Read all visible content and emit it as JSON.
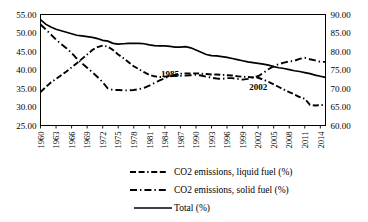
{
  "chart_data": {
    "type": "line",
    "title": "",
    "xlabel": "",
    "ylabel": "",
    "grid": false,
    "legend_position": "bottom",
    "x": [
      1960,
      1961,
      1962,
      1963,
      1964,
      1965,
      1966,
      1967,
      1968,
      1969,
      1970,
      1971,
      1972,
      1973,
      1974,
      1975,
      1976,
      1977,
      1978,
      1979,
      1980,
      1981,
      1982,
      1983,
      1984,
      1985,
      1986,
      1987,
      1988,
      1989,
      1990,
      1991,
      1992,
      1993,
      1994,
      1995,
      1996,
      1997,
      1998,
      1999,
      2000,
      2001,
      2002,
      2003,
      2004,
      2005,
      2006,
      2007,
      2008,
      2009,
      2010,
      2011,
      2012,
      2013,
      2014,
      2015
    ],
    "x_tick_labels": [
      "1960",
      "1963",
      "1966",
      "1969",
      "1972",
      "1975",
      "1978",
      "1981",
      "1984",
      "1987",
      "1990",
      "1993",
      "1996",
      "1999",
      "2002",
      "2005",
      "2008",
      "2011",
      "2014"
    ],
    "left_axis": {
      "ticks": [
        "55.00",
        "50.00",
        "45.00",
        "40.00",
        "35.00",
        "30.00",
        "25.00"
      ],
      "ylim": [
        25.0,
        55.0
      ],
      "applies_to": [
        "CO2 emissions, liquid fuel (%)",
        "CO2 emissions, solid fuel (%)"
      ]
    },
    "right_axis": {
      "ticks": [
        "90.00",
        "85.00",
        "80.00",
        "75.00",
        "70.00",
        "65.00",
        "60.00"
      ],
      "ylim": [
        60.0,
        90.0
      ],
      "applies_to": [
        "Total (%)"
      ]
    },
    "annotations": [
      {
        "text": "1985",
        "x": 1985,
        "y": 38.2
      },
      {
        "text": "2002",
        "x": 2002,
        "y": 34.6
      }
    ],
    "series": [
      {
        "name": "CO2 emissions, liquid fuel (%)",
        "axis": "left",
        "style": "dash-dash-dot",
        "values": [
          34.0,
          35.4,
          36.6,
          37.6,
          38.6,
          39.6,
          40.7,
          41.8,
          43.0,
          44.2,
          45.4,
          46.2,
          46.6,
          46.3,
          45.4,
          44.2,
          43.2,
          42.1,
          41.0,
          40.2,
          39.4,
          38.7,
          38.3,
          38.1,
          38.2,
          38.4,
          38.7,
          39.0,
          39.1,
          39.1,
          39.1,
          39.0,
          38.9,
          38.8,
          38.8,
          38.7,
          38.6,
          38.5,
          38.3,
          38.2,
          38.1,
          38.0,
          37.9,
          37.4,
          36.8,
          36.1,
          35.4,
          34.7,
          34.0,
          33.4,
          32.7,
          32.2,
          30.6,
          30.4,
          30.5,
          30.6
        ]
      },
      {
        "name": "CO2 emissions, solid fuel (%)",
        "axis": "left",
        "style": "dash-dot",
        "values": [
          52.3,
          51.0,
          49.6,
          48.2,
          47.0,
          45.9,
          44.6,
          43.1,
          41.8,
          40.6,
          39.4,
          38.1,
          36.7,
          35.0,
          34.6,
          34.6,
          34.5,
          34.5,
          34.6,
          34.8,
          35.2,
          35.8,
          36.5,
          37.2,
          37.8,
          38.3,
          38.4,
          38.4,
          38.5,
          38.6,
          38.7,
          38.5,
          38.2,
          37.9,
          37.7,
          37.6,
          37.8,
          37.8,
          37.6,
          37.4,
          37.6,
          38.0,
          38.3,
          39.2,
          40.2,
          41.0,
          41.6,
          42.0,
          42.3,
          42.5,
          43.0,
          43.3,
          42.9,
          42.6,
          42.2,
          42.2
        ]
      },
      {
        "name": "Total (%)",
        "axis": "right",
        "style": "solid",
        "values": [
          88.6,
          87.4,
          86.6,
          86.0,
          85.6,
          85.2,
          84.8,
          84.4,
          84.2,
          84.0,
          83.8,
          83.5,
          83.0,
          82.8,
          82.2,
          82.0,
          82.1,
          82.2,
          82.2,
          82.2,
          82.1,
          81.8,
          81.6,
          81.5,
          81.5,
          81.4,
          81.2,
          81.2,
          81.3,
          81.0,
          80.4,
          79.8,
          79.2,
          78.9,
          78.8,
          78.6,
          78.4,
          78.1,
          77.8,
          77.5,
          77.2,
          77.0,
          76.8,
          76.6,
          76.3,
          75.9,
          75.6,
          75.4,
          75.1,
          74.8,
          74.6,
          74.3,
          74.0,
          73.6,
          73.3,
          73.0
        ]
      }
    ]
  },
  "legend": {
    "items": [
      {
        "label": "CO2 emissions, liquid fuel (%)",
        "style": "dash-dash-dot"
      },
      {
        "label": "CO2 emissions, solid fuel (%)",
        "style": "dash-dot"
      },
      {
        "label": "Total (%)",
        "style": "solid"
      }
    ]
  }
}
